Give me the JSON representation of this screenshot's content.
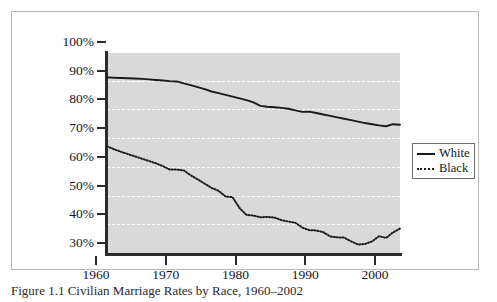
{
  "figure": {
    "caption": "Figure 1.1   Civilian Marriage Rates by Race, 1960–2002",
    "background_color": "#ffffff",
    "frame_border_color": "#b9b9b9"
  },
  "legend": {
    "position": "right",
    "entries": [
      {
        "label": "White",
        "style": "solid",
        "icon": "solid-line-swatch"
      },
      {
        "label": "Black",
        "style": "dotted",
        "icon": "dotted-line-swatch"
      }
    ]
  },
  "axes": {
    "y_tick_labels": [
      "100%",
      "90%",
      "80%",
      "70%",
      "60%",
      "50%",
      "40%",
      "30%"
    ],
    "x_tick_labels": [
      "1960",
      "1970",
      "1980",
      "1990",
      "2000"
    ]
  },
  "colors": {
    "plot_background": "#d9d9d9",
    "gridline": "#ffffff",
    "axis": "#2b2b2b",
    "series_line": "#1a1a1a",
    "text": "#16161a"
  },
  "chart_data": {
    "type": "line",
    "title": "",
    "subtitle": "",
    "xlabel": "",
    "ylabel": "",
    "xlim": [
      1960,
      2002
    ],
    "ylim": [
      30,
      100
    ],
    "y_unit": "percent",
    "grid": true,
    "grid_axis": "y",
    "grid_style": "dashed",
    "legend_position": "right",
    "y_ticks": [
      30,
      40,
      50,
      60,
      70,
      80,
      90,
      100
    ],
    "x_ticks": [
      1960,
      1970,
      1980,
      1990,
      2000
    ],
    "x": [
      1960,
      1961,
      1962,
      1963,
      1964,
      1965,
      1966,
      1967,
      1968,
      1969,
      1970,
      1971,
      1972,
      1973,
      1974,
      1975,
      1976,
      1977,
      1978,
      1979,
      1980,
      1981,
      1982,
      1983,
      1984,
      1985,
      1986,
      1987,
      1988,
      1989,
      1990,
      1991,
      1992,
      1993,
      1994,
      1995,
      1996,
      1997,
      1998,
      1999,
      2000,
      2001,
      2002
    ],
    "series": [
      {
        "name": "White",
        "style": "solid",
        "values": [
          91.5,
          91.4,
          91.3,
          91.2,
          91.1,
          91.0,
          90.8,
          90.6,
          90.4,
          90.2,
          90.1,
          89.4,
          88.8,
          88.1,
          87.4,
          86.6,
          86.0,
          85.4,
          84.8,
          84.2,
          83.6,
          82.8,
          81.6,
          81.3,
          81.1,
          80.9,
          80.6,
          80.0,
          79.5,
          79.6,
          79.1,
          78.6,
          78.1,
          77.6,
          77.1,
          76.6,
          76.1,
          75.6,
          75.2,
          74.8,
          74.5,
          75.2,
          75.0
        ]
      },
      {
        "name": "Black",
        "style": "dotted",
        "values": [
          67.5,
          66.5,
          65.6,
          64.8,
          64.0,
          63.2,
          62.4,
          61.6,
          60.6,
          59.4,
          59.4,
          59.1,
          57.4,
          56.0,
          54.5,
          53.0,
          52.0,
          50.0,
          49.8,
          46.0,
          43.6,
          43.4,
          42.8,
          42.9,
          42.7,
          41.8,
          41.3,
          40.9,
          39.2,
          38.3,
          38.2,
          37.6,
          36.1,
          35.8,
          35.7,
          34.4,
          33.3,
          33.5,
          34.4,
          36.2,
          35.6,
          37.5,
          38.9
        ]
      }
    ]
  }
}
